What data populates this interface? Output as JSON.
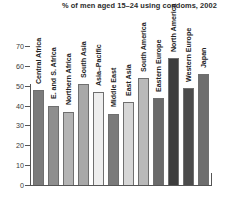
{
  "chart_data": {
    "type": "bar",
    "title": "% of men aged 15–24 using condoms, 2002",
    "xlabel": "",
    "ylabel": "",
    "ylim": [
      0,
      70
    ],
    "yticks": [
      0,
      10,
      20,
      30,
      40,
      50,
      60,
      70
    ],
    "grid": false,
    "legend": "none",
    "categories": [
      "Central Africa",
      "E. and S. Africa",
      "Northern Africa",
      "South Asia",
      "Asia–Pacific",
      "Middle East",
      "East Asia",
      "South America",
      "Eastern Europe",
      "North America",
      "Western Europe",
      "Japan"
    ],
    "values": [
      48,
      40,
      37,
      51,
      47,
      36,
      42,
      54,
      44,
      64,
      49,
      56
    ],
    "bar_colors": [
      "#7b7b7b",
      "#8e8e8e",
      "#b4b4b4",
      "#a8a8a8",
      "#eeeeee",
      "#7a7a7a",
      "#d6d6d6",
      "#b9b9b9",
      "#6a6a6a",
      "#3d3d3d",
      "#4b4b4b",
      "#6e6e6e"
    ]
  },
  "axis": {
    "tick_color": "#555555",
    "label_color": "#3a3a3a"
  }
}
